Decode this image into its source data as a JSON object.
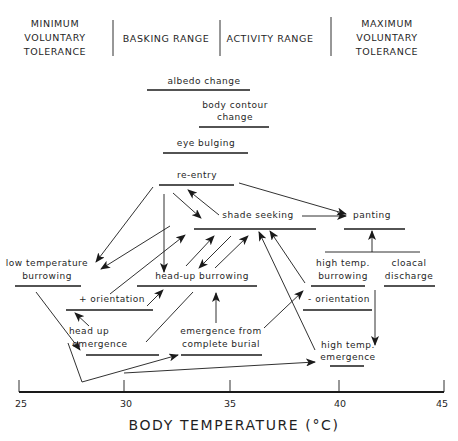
{
  "header": {
    "zones": [
      {
        "lines": [
          "MINIMUM",
          "VOLUNTARY",
          "TOLERANCE"
        ]
      },
      {
        "lines": [
          "BASKING RANGE"
        ]
      },
      {
        "lines": [
          "ACTIVITY RANGE"
        ]
      },
      {
        "lines": [
          "MAXIMUM",
          "VOLUNTARY",
          "TOLERANCE"
        ]
      }
    ]
  },
  "behaviors": [
    {
      "id": "albedo",
      "lines": [
        "albedo change"
      ],
      "range_c": [
        31.2,
        35.5
      ]
    },
    {
      "id": "body_contour",
      "lines": [
        "body contour",
        "change"
      ],
      "range_c": [
        33.8,
        37.0
      ]
    },
    {
      "id": "eye_bulging",
      "lines": [
        "eye bulging"
      ],
      "range_c": [
        32.0,
        35.5
      ]
    },
    {
      "id": "re_entry",
      "lines": [
        "re-entry"
      ],
      "range_c": [
        31.8,
        35.3
      ]
    },
    {
      "id": "shade_seeking",
      "lines": [
        "shade seeking"
      ],
      "range_c": [
        33.0,
        38.9
      ]
    },
    {
      "id": "panting",
      "lines": [
        "panting"
      ],
      "range_c": [
        39.5,
        42.3
      ]
    },
    {
      "id": "low_temp_burrowing",
      "lines": [
        "low temperature",
        "burrowing"
      ],
      "range_c": [
        24.8,
        28.3
      ]
    },
    {
      "id": "head_up_burrowing",
      "lines": [
        "head-up  burrowing"
      ],
      "range_c": [
        30.7,
        36.7
      ]
    },
    {
      "id": "high_temp_burrowing",
      "lines": [
        "high temp.",
        "burrowing"
      ],
      "range_c": [
        39.4,
        41.8
      ]
    },
    {
      "id": "cloacal_discharge",
      "lines": [
        "cloacal",
        "discharge"
      ],
      "range_c": [
        42.1,
        44.3
      ]
    },
    {
      "id": "plus_orientation",
      "lines": [
        "+ orientation"
      ],
      "range_c": [
        27.2,
        31.0
      ]
    },
    {
      "id": "minus_orientation",
      "lines": [
        "- orientation"
      ],
      "range_c": [
        38.8,
        41.7
      ]
    },
    {
      "id": "head_up_emergence",
      "lines": [
        "head up",
        "emergence"
      ],
      "range_c": [
        28.3,
        31.7
      ]
    },
    {
      "id": "emergence_complete_burial",
      "lines": [
        "emergence from",
        "complete burial"
      ],
      "range_c": [
        33.6,
        37.4
      ]
    },
    {
      "id": "high_temp_emergence",
      "lines": [
        "high temp.",
        "emergence"
      ],
      "range_c": [
        40.3,
        41.9
      ]
    }
  ],
  "transitions": [
    [
      "re_entry",
      "low_temp_burrowing"
    ],
    [
      "re_entry",
      "head_up_burrowing"
    ],
    [
      "re_entry",
      "shade_seeking"
    ],
    [
      "shade_seeking",
      "re_entry"
    ],
    [
      "re_entry",
      "panting"
    ],
    [
      "shade_seeking",
      "panting"
    ],
    [
      "shade_seeking",
      "low_temp_burrowing"
    ],
    [
      "plus_orientation",
      "shade_seeking"
    ],
    [
      "head_up_burrowing",
      "shade_seeking"
    ],
    [
      "shade_seeking",
      "head_up_burrowing"
    ],
    [
      "high_temp_burrowing",
      "shade_seeking"
    ],
    [
      "high_temp_emergence",
      "shade_seeking"
    ],
    [
      "high_temp_burrowing",
      "panting"
    ],
    [
      "cloacal_discharge",
      "panting"
    ],
    [
      "plus_orientation",
      "head_up_burrowing"
    ],
    [
      "head_up_emergence",
      "plus_orientation"
    ],
    [
      "head_up_emergence",
      "head_up_burrowing"
    ],
    [
      "emergence_complete_burial",
      "head_up_burrowing"
    ],
    [
      "emergence_complete_burial",
      "minus_orientation"
    ],
    [
      "low_temp_burrowing",
      "head_up_emergence"
    ],
    [
      "low_temp_burrowing",
      "emergence_complete_burial"
    ],
    [
      "minus_orientation",
      "high_temp_emergence"
    ],
    [
      "low_temp_burrowing",
      "high_temp_emergence"
    ]
  ],
  "axis": {
    "title": "BODY TEMPERATURE (°C)",
    "ticks": [
      "25",
      "30",
      "35",
      "40",
      "45"
    ],
    "range": [
      25,
      45
    ]
  }
}
